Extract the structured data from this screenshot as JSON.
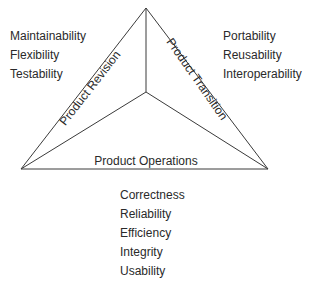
{
  "diagram": {
    "type": "triangle",
    "line_color": "#3a3a3a",
    "vertices": {
      "apex": [
        146,
        8
      ],
      "center": [
        146,
        92
      ],
      "left": [
        21,
        169
      ],
      "right": [
        268,
        169
      ]
    },
    "sides": {
      "revision": {
        "label": "Product Revision"
      },
      "transition": {
        "label": "Product Transition"
      },
      "operations": {
        "label": "Product Operations"
      }
    },
    "lists": {
      "revision": [
        "Maintainability",
        "Flexibility",
        "Testability"
      ],
      "transition": [
        "Portability",
        "Reusability",
        "Interoperability"
      ],
      "operations": [
        "Correctness",
        "Reliability",
        "Efficiency",
        "Integrity",
        "Usability"
      ]
    }
  }
}
